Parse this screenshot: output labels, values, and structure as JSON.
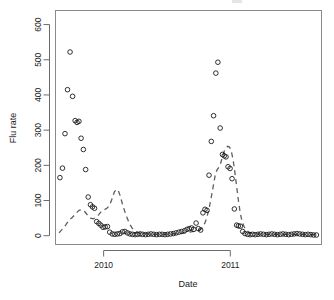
{
  "chart_data": {
    "type": "scatter",
    "title": "",
    "xlabel": "Date",
    "ylabel": "Flu rate",
    "grid": false,
    "legend": "none",
    "xlim": [
      2009.62,
      2011.72
    ],
    "ylim": [
      -25,
      640
    ],
    "x_ticks": [
      2010,
      2011
    ],
    "x_tick_labels": [
      "2010",
      "2011"
    ],
    "y_ticks": [
      0,
      100,
      200,
      300,
      400,
      500,
      600
    ],
    "y_tick_labels": [
      "0",
      "100",
      "200",
      "300",
      "400",
      "500",
      "600"
    ],
    "series": [
      {
        "name": "observed",
        "type": "scatter",
        "marker": "open-circle",
        "color": "#1a1a1a",
        "points": [
          [
            2009.655,
            165
          ],
          [
            2009.675,
            192
          ],
          [
            2009.695,
            290
          ],
          [
            2009.715,
            415
          ],
          [
            2009.735,
            522
          ],
          [
            2009.755,
            396
          ],
          [
            2009.775,
            327
          ],
          [
            2009.79,
            322
          ],
          [
            2009.805,
            325
          ],
          [
            2009.822,
            277
          ],
          [
            2009.84,
            245
          ],
          [
            2009.858,
            188
          ],
          [
            2009.878,
            110
          ],
          [
            2009.896,
            88
          ],
          [
            2009.912,
            82
          ],
          [
            2009.928,
            78
          ],
          [
            2009.945,
            40
          ],
          [
            2009.962,
            35
          ],
          [
            2009.978,
            30
          ],
          [
            2009.995,
            24
          ],
          [
            2010.012,
            25
          ],
          [
            2010.03,
            26
          ],
          [
            2010.048,
            10
          ],
          [
            2010.068,
            5
          ],
          [
            2010.088,
            4
          ],
          [
            2010.108,
            5
          ],
          [
            2010.128,
            6
          ],
          [
            2010.148,
            11
          ],
          [
            2010.168,
            12
          ],
          [
            2010.188,
            8
          ],
          [
            2010.208,
            5
          ],
          [
            2010.228,
            4
          ],
          [
            2010.248,
            3
          ],
          [
            2010.268,
            4
          ],
          [
            2010.288,
            5
          ],
          [
            2010.308,
            4
          ],
          [
            2010.33,
            3
          ],
          [
            2010.352,
            4
          ],
          [
            2010.374,
            5
          ],
          [
            2010.396,
            4
          ],
          [
            2010.418,
            3
          ],
          [
            2010.44,
            4
          ],
          [
            2010.462,
            4
          ],
          [
            2010.484,
            3
          ],
          [
            2010.506,
            4
          ],
          [
            2010.528,
            5
          ],
          [
            2010.55,
            6
          ],
          [
            2010.572,
            8
          ],
          [
            2010.594,
            10
          ],
          [
            2010.616,
            12
          ],
          [
            2010.638,
            14
          ],
          [
            2010.658,
            18
          ],
          [
            2010.676,
            20
          ],
          [
            2010.694,
            22
          ],
          [
            2010.712,
            18
          ],
          [
            2010.73,
            36
          ],
          [
            2010.748,
            20
          ],
          [
            2010.766,
            16
          ],
          [
            2010.784,
            65
          ],
          [
            2010.8,
            75
          ],
          [
            2010.816,
            72
          ],
          [
            2010.832,
            172
          ],
          [
            2010.85,
            268
          ],
          [
            2010.868,
            341
          ],
          [
            2010.886,
            462
          ],
          [
            2010.902,
            493
          ],
          [
            2010.92,
            306
          ],
          [
            2010.938,
            231
          ],
          [
            2010.952,
            227
          ],
          [
            2010.966,
            224
          ],
          [
            2010.982,
            196
          ],
          [
            2010.998,
            191
          ],
          [
            2011.014,
            162
          ],
          [
            2011.032,
            76
          ],
          [
            2011.05,
            30
          ],
          [
            2011.064,
            28
          ],
          [
            2011.08,
            27
          ],
          [
            2011.098,
            12
          ],
          [
            2011.116,
            6
          ],
          [
            2011.136,
            4
          ],
          [
            2011.156,
            3
          ],
          [
            2011.176,
            4
          ],
          [
            2011.196,
            3
          ],
          [
            2011.218,
            4
          ],
          [
            2011.24,
            5
          ],
          [
            2011.262,
            4
          ],
          [
            2011.284,
            3
          ],
          [
            2011.306,
            4
          ],
          [
            2011.328,
            5
          ],
          [
            2011.35,
            4
          ],
          [
            2011.372,
            3
          ],
          [
            2011.394,
            4
          ],
          [
            2011.416,
            5
          ],
          [
            2011.438,
            4
          ],
          [
            2011.46,
            3
          ],
          [
            2011.482,
            4
          ],
          [
            2011.504,
            5
          ],
          [
            2011.526,
            6
          ],
          [
            2011.548,
            5
          ],
          [
            2011.57,
            4
          ],
          [
            2011.592,
            3
          ],
          [
            2011.614,
            4
          ],
          [
            2011.636,
            3
          ],
          [
            2011.658,
            2
          ],
          [
            2011.68,
            2
          ]
        ]
      },
      {
        "name": "predicted",
        "type": "line",
        "linestyle": "dashed",
        "color": "#5d5d5d",
        "points": [
          [
            2009.648,
            8
          ],
          [
            2009.672,
            18
          ],
          [
            2009.7,
            30
          ],
          [
            2009.726,
            44
          ],
          [
            2009.752,
            52
          ],
          [
            2009.778,
            62
          ],
          [
            2009.806,
            72
          ],
          [
            2009.83,
            74
          ],
          [
            2009.852,
            68
          ],
          [
            2009.874,
            58
          ],
          [
            2009.896,
            50
          ],
          [
            2009.918,
            48
          ],
          [
            2009.94,
            52
          ],
          [
            2009.962,
            60
          ],
          [
            2009.984,
            70
          ],
          [
            2010.006,
            74
          ],
          [
            2010.026,
            78
          ],
          [
            2010.046,
            86
          ],
          [
            2010.066,
            104
          ],
          [
            2010.084,
            124
          ],
          [
            2010.1,
            132
          ],
          [
            2010.116,
            128
          ],
          [
            2010.132,
            112
          ],
          [
            2010.15,
            88
          ],
          [
            2010.168,
            68
          ],
          [
            2010.186,
            50
          ],
          [
            2010.204,
            34
          ],
          [
            2010.224,
            22
          ],
          [
            2010.246,
            14
          ],
          [
            2010.27,
            9
          ],
          [
            2010.3,
            6
          ],
          [
            2010.34,
            5
          ],
          [
            2010.39,
            4
          ],
          [
            2010.44,
            4
          ],
          [
            2010.49,
            4
          ],
          [
            2010.54,
            5
          ],
          [
            2010.59,
            6
          ],
          [
            2010.64,
            8
          ],
          [
            2010.68,
            10
          ],
          [
            2010.71,
            12
          ],
          [
            2010.74,
            14
          ],
          [
            2010.766,
            18
          ],
          [
            2010.79,
            28
          ],
          [
            2010.812,
            48
          ],
          [
            2010.832,
            76
          ],
          [
            2010.85,
            110
          ],
          [
            2010.866,
            142
          ],
          [
            2010.88,
            170
          ],
          [
            2010.896,
            188
          ],
          [
            2010.91,
            194
          ],
          [
            2010.924,
            206
          ],
          [
            2010.938,
            224
          ],
          [
            2010.952,
            240
          ],
          [
            2010.966,
            250
          ],
          [
            2010.98,
            254
          ],
          [
            2010.994,
            252
          ],
          [
            2011.008,
            240
          ],
          [
            2011.022,
            216
          ],
          [
            2011.036,
            180
          ],
          [
            2011.05,
            140
          ],
          [
            2011.064,
            100
          ],
          [
            2011.078,
            66
          ],
          [
            2011.092,
            42
          ],
          [
            2011.108,
            26
          ],
          [
            2011.126,
            16
          ],
          [
            2011.148,
            10
          ],
          [
            2011.176,
            7
          ],
          [
            2011.21,
            5
          ],
          [
            2011.25,
            4
          ],
          [
            2011.3,
            4
          ],
          [
            2011.36,
            4
          ],
          [
            2011.42,
            4
          ],
          [
            2011.48,
            4
          ],
          [
            2011.54,
            4
          ],
          [
            2011.6,
            3
          ],
          [
            2011.66,
            3
          ],
          [
            2011.69,
            3
          ]
        ]
      }
    ]
  },
  "axes": {
    "y_label": "Flu rate",
    "x_label": "Date"
  }
}
